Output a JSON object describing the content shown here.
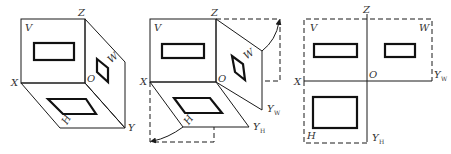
{
  "diagram1": {
    "title": "Three-plane projection system (3D view)",
    "labels": {
      "V": "V",
      "Z": "Z",
      "W": "W",
      "X": "X",
      "O": "O",
      "H": "H",
      "Y": "Y"
    }
  },
  "diagram2": {
    "title": "Unfolding the H and W planes",
    "labels": {
      "V": "V",
      "Z": "Z",
      "W": "W",
      "X": "X",
      "O": "O",
      "H": "H",
      "Yw": "Y",
      "Yw_sub": "W",
      "Yh": "Y",
      "Yh_sub": "H"
    }
  },
  "diagram3": {
    "title": "Unfolded three-view layout",
    "labels": {
      "V": "V",
      "Z": "Z",
      "W": "W",
      "X": "X",
      "O": "O",
      "H": "H",
      "Yw": "Y",
      "Yw_sub": "W",
      "Yh": "Y",
      "Yh_sub": "H"
    }
  },
  "colors": {
    "line": "#1a1a1a",
    "text": "#333333",
    "background": "#ffffff"
  }
}
